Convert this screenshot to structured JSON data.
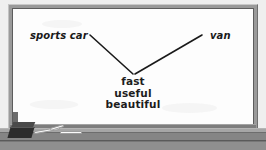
{
  "diagram": {
    "medium": "whiteboard",
    "nodes": [
      {
        "id": "left",
        "label": "sports car",
        "style": "italic"
      },
      {
        "id": "right",
        "label": "van",
        "style": "italic"
      }
    ],
    "center_items": [
      {
        "label": "fast"
      },
      {
        "label": "useful"
      },
      {
        "label": "beautiful"
      }
    ],
    "connectors": [
      {
        "from": "left",
        "to": "center",
        "x1": 78,
        "y1": 27,
        "x2": 121,
        "y2": 66
      },
      {
        "from": "right",
        "to": "center",
        "x1": 190,
        "y1": 27,
        "x2": 123,
        "y2": 66
      }
    ],
    "colors": {
      "board_surface": "#fdfdfd",
      "ink": "#1a1a1a",
      "frame": "#9a9a9a",
      "tray": "#858585",
      "eraser": "#2c2c2c",
      "chalk": "#fbfbfb",
      "backdrop": "#efefef"
    }
  },
  "tray": {
    "eraser_label": "eraser",
    "chalk_count": 3
  }
}
